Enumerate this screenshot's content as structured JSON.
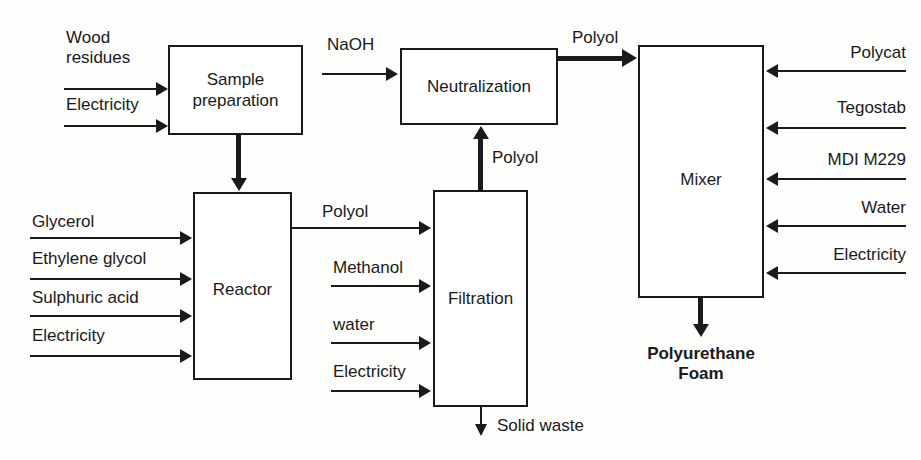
{
  "diagram": {
    "units": [
      {
        "id": "sample-preparation",
        "label": "Sample\npreparation"
      },
      {
        "id": "neutralization",
        "label": "Neutralization"
      },
      {
        "id": "mixer",
        "label": "Mixer"
      },
      {
        "id": "reactor",
        "label": "Reactor"
      },
      {
        "id": "filtration",
        "label": "Filtration"
      }
    ],
    "sample_preparation_inputs": [
      {
        "id": "wood-residues",
        "label": "Wood\nresidues"
      },
      {
        "id": "electricity",
        "label": "Electricity"
      }
    ],
    "reactor_inputs": [
      {
        "id": "glycerol",
        "label": "Glycerol"
      },
      {
        "id": "ethylene-glycol",
        "label": "Ethylene glycol"
      },
      {
        "id": "sulphuric-acid",
        "label": "Sulphuric acid"
      },
      {
        "id": "electricity",
        "label": "Electricity"
      }
    ],
    "filtration_inputs": [
      {
        "id": "methanol",
        "label": "Methanol"
      },
      {
        "id": "water",
        "label": "water"
      },
      {
        "id": "electricity",
        "label": "Electricity"
      }
    ],
    "mixer_inputs": [
      {
        "id": "polycat",
        "label": "Polycat"
      },
      {
        "id": "tegostab",
        "label": "Tegostab"
      },
      {
        "id": "mdi-m229",
        "label": "MDI M229"
      },
      {
        "id": "water",
        "label": "Water"
      },
      {
        "id": "electricity",
        "label": "Electricity"
      }
    ],
    "stream_labels": {
      "naoh": "NaOH",
      "polyol_reactor_to_filtration": "Polyol",
      "polyol_filtration_to_neutralization": "Polyol",
      "polyol_neutralization_to_mixer": "Polyol"
    },
    "outputs": [
      {
        "id": "solid-waste",
        "label": "Solid waste"
      },
      {
        "id": "polyurethane-foam",
        "label": "Polyurethane\nFoam"
      }
    ],
    "colors": {
      "line": "#1a1a1a",
      "box_fill": "#ffffff",
      "background": "#fdfdfc"
    }
  }
}
